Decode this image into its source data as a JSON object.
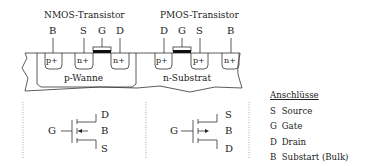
{
  "nmos": {
    "title": "NMOS-Transistor",
    "terminals": [
      "B",
      "S",
      "G",
      "D"
    ],
    "regions": [
      "p+",
      "n+",
      "n+"
    ],
    "well": "p-Wanne",
    "symbol": {
      "gate": "G",
      "top": "D",
      "mid": "B",
      "bottom": "S"
    }
  },
  "pmos": {
    "title": "PMOS-Transistor",
    "terminals": [
      "D",
      "G",
      "S",
      "B"
    ],
    "regions": [
      "p+",
      "p+",
      "n+"
    ],
    "substrate": "n-Substrat",
    "symbol": {
      "gate": "G",
      "top": "S",
      "mid": "B",
      "bottom": "D"
    }
  },
  "legend": {
    "title": "Anschlüsse",
    "items": [
      {
        "key": "S",
        "label": "Source"
      },
      {
        "key": "G",
        "label": "Gate"
      },
      {
        "key": "D",
        "label": "Drain"
      },
      {
        "key": "B",
        "label": "Substart (Bulk)"
      }
    ]
  }
}
